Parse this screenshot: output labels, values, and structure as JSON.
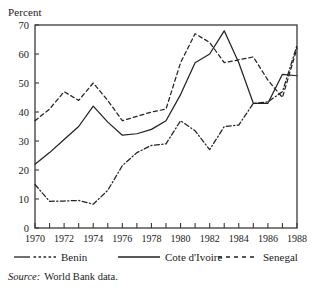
{
  "chart_data": {
    "type": "line",
    "title": "",
    "xlabel": "",
    "ylabel": "Percent",
    "ylim": [
      0,
      70
    ],
    "xlim": [
      1970,
      1988
    ],
    "ytick_labels": [
      "0",
      "10",
      "20",
      "30",
      "40",
      "50",
      "60",
      "70"
    ],
    "yticks": [
      0,
      10,
      20,
      30,
      40,
      50,
      60,
      70
    ],
    "xtick_labels": [
      "1970",
      "1972",
      "1974",
      "1976",
      "1978",
      "1980",
      "1982",
      "1984",
      "1986",
      "1988"
    ],
    "xticks_major": [
      1970,
      1972,
      1974,
      1976,
      1978,
      1980,
      1982,
      1984,
      1986,
      1988
    ],
    "xticks_all": [
      1970,
      1971,
      1972,
      1973,
      1974,
      1975,
      1976,
      1977,
      1978,
      1979,
      1980,
      1981,
      1982,
      1983,
      1984,
      1985,
      1986,
      1987,
      1988
    ],
    "grid": false,
    "legend_position": "below",
    "x": [
      1970,
      1971,
      1972,
      1973,
      1974,
      1975,
      1976,
      1977,
      1978,
      1979,
      1980,
      1981,
      1982,
      1983,
      1984,
      1985,
      1986,
      1987,
      1988
    ],
    "series": [
      {
        "name": "Benin",
        "style": "dash-dot",
        "color": "#222222",
        "values": [
          15.0,
          9.2,
          9.3,
          9.5,
          8.2,
          13.0,
          21.5,
          26.0,
          28.5,
          29.0,
          37.0,
          33.5,
          27.0,
          35.0,
          35.5,
          43.0,
          43.5,
          47.0,
          63.0
        ]
      },
      {
        "name": "Cote d'Ivoire",
        "style": "solid",
        "color": "#222222",
        "values": [
          22.0,
          26.0,
          30.5,
          35.0,
          42.0,
          36.5,
          32.0,
          32.5,
          34.0,
          37.0,
          46.0,
          57.0,
          60.0,
          68.0,
          57.0,
          43.0,
          43.0,
          53.0,
          52.5
        ]
      },
      {
        "name": "Senegal",
        "style": "dashed",
        "color": "#222222",
        "values": [
          37.0,
          41.0,
          47.0,
          44.0,
          50.0,
          44.0,
          37.0,
          38.5,
          40.0,
          41.0,
          57.0,
          67.0,
          64.0,
          57.0,
          58.0,
          59.0,
          51.0,
          45.0,
          62.0
        ]
      }
    ]
  },
  "axis": {
    "unit_label": "Percent"
  },
  "legend": {
    "entries": [
      {
        "label": "Benin",
        "style": "dash-dot"
      },
      {
        "label": "Cote d'Ivoire",
        "style": "solid"
      },
      {
        "label": "Senegal",
        "style": "dashed"
      }
    ]
  },
  "source": {
    "prefix": "Source:",
    "text": "World Bank data."
  }
}
